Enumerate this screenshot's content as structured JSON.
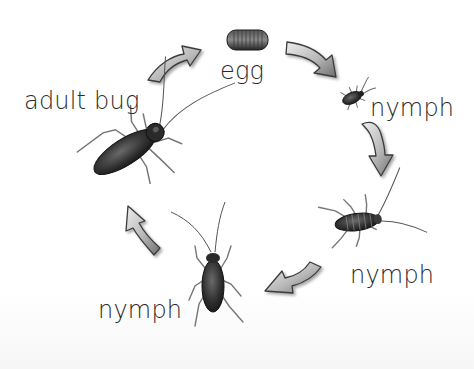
{
  "diagram": {
    "title": "",
    "type": "life-cycle",
    "stages": [
      {
        "id": "egg",
        "label": "egg"
      },
      {
        "id": "nymph-1",
        "label": "nymph"
      },
      {
        "id": "nymph-2",
        "label": "nymph"
      },
      {
        "id": "nymph-3",
        "label": "nymph"
      },
      {
        "id": "adult",
        "label": "adult bug"
      }
    ],
    "flow": [
      "egg",
      "nymph-1",
      "nymph-2",
      "nymph-3",
      "adult",
      "egg"
    ],
    "direction": "clockwise"
  },
  "colors": {
    "text": "#2a2a2a",
    "arrow_light": "#e6e6e6",
    "arrow_dark": "#7a7a7a",
    "arrow_outline": "#3a3a3a",
    "bug_body": "#2b2b2b",
    "background": "#ffffff"
  }
}
